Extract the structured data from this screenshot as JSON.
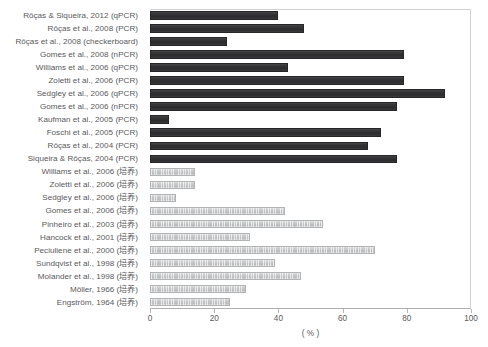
{
  "chart_data": {
    "type": "bar",
    "orientation": "horizontal",
    "title": "",
    "subtitle": "",
    "xlabel": "( % )",
    "ylabel": "",
    "xlim": [
      0,
      100
    ],
    "xticks": [
      0,
      20,
      40,
      60,
      80,
      100
    ],
    "xtick_labels": [
      "0",
      "20",
      "40",
      "60",
      "80",
      "100"
    ],
    "grid": false,
    "legend": null,
    "colors": {
      "molecular_bar": "#303032",
      "culture_bar": "#c2c3c4",
      "axis": "#b6b6b6",
      "text": "#59595b",
      "plot_border": "#d2d2d2",
      "background": "#ffffff"
    },
    "categories": [
      "Rôças & Siqueira, 2012 (qPCR)",
      "Rôças et al., 2008 (PCR)",
      "Rôças et al., 2008 (checkerboard)",
      "Gomes et al., 2008 (nPCR)",
      "Williams et al., 2006 (qPCR)",
      "Zoletti et al., 2006 (PCR)",
      "Sedgley et al., 2006 (qPCR)",
      "Gomes et al., 2006 (nPCR)",
      "Kaufman et al., 2005 (PCR)",
      "Foschi et al., 2005 (PCR)",
      "Rôças et al., 2004 (PCR)",
      "Siqueira & Rôças, 2004 (PCR)",
      "Williams et al., 2006 (培养)",
      "Zoletti et al., 2006 (培养)",
      "Sedgley et al., 2006 (培养)",
      "Gomes et al., 2006 (培养)",
      "Pinheiro et al., 2003 (培养)",
      "Hancock et al., 2001 (培养)",
      "Peciuliene et al., 2000 (培养)",
      "Sundqvist et al., 1998 (培养)",
      "Molander et al., 1998 (培养)",
      "Möller, 1966 (培养)",
      "Engström, 1964 (培养)"
    ],
    "values": [
      40,
      48,
      24,
      79,
      43,
      79,
      92,
      77,
      6,
      72,
      68,
      77,
      14,
      14,
      8,
      42,
      54,
      31,
      70,
      39,
      47,
      30,
      25
    ],
    "series_group": [
      "molecular",
      "molecular",
      "molecular",
      "molecular",
      "molecular",
      "molecular",
      "molecular",
      "molecular",
      "molecular",
      "molecular",
      "molecular",
      "molecular",
      "culture",
      "culture",
      "culture",
      "culture",
      "culture",
      "culture",
      "culture",
      "culture",
      "culture",
      "culture",
      "culture"
    ]
  }
}
